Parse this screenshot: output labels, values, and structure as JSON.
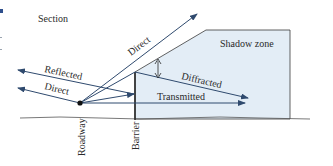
{
  "title": "Section",
  "colors": {
    "arrow": "#2f4a6e",
    "shadow_fill": "#e3edf6",
    "outline": "#3a3a3a",
    "text": "#2a2a2a",
    "left_marker": "#2e4f8c"
  },
  "regions": {
    "shadow_zone": "Shadow zone"
  },
  "rays": {
    "direct_up": "Direct",
    "reflected": "Reflected",
    "direct_left": "Direct",
    "diffracted": "Diffracted",
    "transmitted": "Transmitted"
  },
  "axis_labels": {
    "roadway": "Roadway",
    "barrier": "Barrier"
  }
}
